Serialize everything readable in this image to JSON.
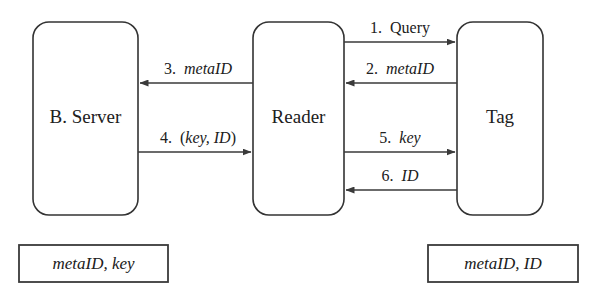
{
  "diagram": {
    "background_color": "#ffffff",
    "stroke_color": "#3a3a3a",
    "text_color": "#202020",
    "nodes": [
      {
        "id": "backend-server",
        "label": "B. Server",
        "shape": "rounded-rectangle",
        "x": 33,
        "y": 22,
        "width": 105,
        "height": 193,
        "radius": 16
      },
      {
        "id": "reader",
        "label": "Reader",
        "shape": "rounded-rectangle",
        "x": 253,
        "y": 22,
        "width": 91,
        "height": 193,
        "radius": 16
      },
      {
        "id": "tag",
        "label": "Tag",
        "shape": "rounded-rectangle",
        "x": 457,
        "y": 22,
        "width": 86,
        "height": 193,
        "radius": 16
      }
    ],
    "stores": [
      {
        "id": "server-store",
        "label": "metaID, key",
        "shape": "rectangle",
        "x": 19,
        "y": 245,
        "width": 149,
        "height": 37
      },
      {
        "id": "tag-store",
        "label": "metaID, ID",
        "shape": "rectangle",
        "x": 428,
        "y": 245,
        "width": 150,
        "height": 37
      }
    ],
    "messages": [
      {
        "step": "1.",
        "number": "1",
        "text": "Query",
        "italic_text": "",
        "full_label": "1. Query",
        "from": "reader",
        "to": "tag",
        "direction": "right",
        "x1": 344,
        "x2": 457,
        "y": 42,
        "label_x": 400,
        "label_y": 30,
        "italic": false
      },
      {
        "step": "2.",
        "number": "2",
        "text": "",
        "italic_text": "metaID",
        "full_label": "2. metaID",
        "from": "tag",
        "to": "reader",
        "direction": "left",
        "x1": 457,
        "x2": 344,
        "y": 83,
        "label_x": 400,
        "label_y": 71,
        "italic": true
      },
      {
        "step": "3.",
        "number": "3",
        "text": "",
        "italic_text": "metaID",
        "full_label": "3. metaID",
        "from": "reader",
        "to": "backend-server",
        "direction": "left",
        "x1": 253,
        "x2": 138,
        "y": 83,
        "label_x": 198,
        "label_y": 71,
        "italic": true
      },
      {
        "step": "4.",
        "number": "4",
        "text": "(key, ID)",
        "italic_text": "key, ID",
        "full_label": "4. (key, ID)",
        "from": "backend-server",
        "to": "reader",
        "direction": "right",
        "x1": 138,
        "x2": 253,
        "y": 152,
        "label_x": 198,
        "label_y": 140,
        "italic": true
      },
      {
        "step": "5.",
        "number": "5",
        "text": "",
        "italic_text": "key",
        "full_label": "5. key",
        "from": "reader",
        "to": "tag",
        "direction": "right",
        "x1": 344,
        "x2": 457,
        "y": 152,
        "label_x": 400,
        "label_y": 140,
        "italic": true
      },
      {
        "step": "6.",
        "number": "6",
        "text": "",
        "italic_text": "ID",
        "full_label": "6. ID",
        "from": "tag",
        "to": "reader",
        "direction": "left",
        "x1": 457,
        "x2": 344,
        "y": 190,
        "label_x": 400,
        "label_y": 178,
        "italic": true
      }
    ]
  }
}
